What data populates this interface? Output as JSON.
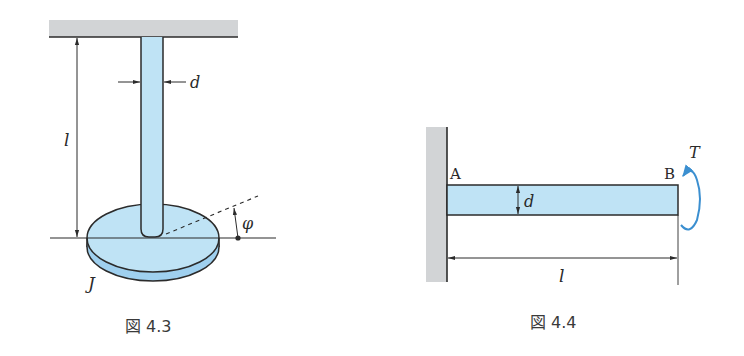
{
  "figures": [
    {
      "id": "fig-4-3",
      "caption": "図 4.3",
      "labels": {
        "length": "l",
        "diameter": "d",
        "angle": "φ",
        "inertia": "J"
      },
      "description": "Torsional pendulum: vertical rod of diameter d and length l fixed to ceiling, with disc of moment of inertia J at bottom, rotation angle φ"
    },
    {
      "id": "fig-4-4",
      "caption": "図 4.4",
      "labels": {
        "end_a": "A",
        "end_b": "B",
        "diameter": "d",
        "length": "l",
        "torque": "T"
      },
      "description": "Cantilever shaft fixed to wall at A, length l, diameter d, torque T applied at free end B"
    }
  ],
  "colors": {
    "rod_fill": "#bfe3f5",
    "disc_side": "#9fd0ef",
    "wall_fill": "#d2d4d6",
    "outline": "#2b2b2b",
    "torque_arrow": "#3b8fd0"
  }
}
